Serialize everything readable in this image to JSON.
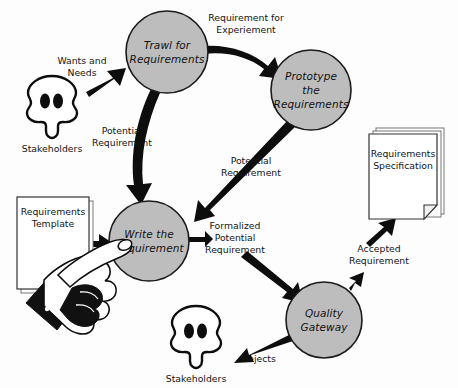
{
  "diagram": {
    "colors": {
      "node_fill": "#bdbdbd",
      "node_stroke": "#1a1a1a",
      "arrow": "#0d0d0d",
      "text": "#141414",
      "background": "#fdfdfd",
      "paper_fill": "#ffffff"
    },
    "nodes": [
      {
        "id": "trawl",
        "lines": [
          "Trawl for",
          "Requirements"
        ],
        "cx": 167,
        "cy": 52,
        "r": 41
      },
      {
        "id": "prototype",
        "lines": [
          "Prototype",
          "the",
          "Requirements"
        ],
        "cx": 311,
        "cy": 90,
        "r": 40
      },
      {
        "id": "write",
        "lines": [
          "Write the",
          "Requirement"
        ],
        "cx": 149,
        "cy": 241,
        "r": 40
      },
      {
        "id": "quality",
        "lines": [
          "Quality",
          "Gateway"
        ],
        "cx": 324,
        "cy": 320,
        "r": 38
      }
    ],
    "edge_labels": [
      {
        "id": "wants-and-needs",
        "lines": [
          "Wants and",
          "Needs"
        ],
        "x": 82,
        "y": 64
      },
      {
        "id": "requirement-for-experiement",
        "lines": [
          "Requirement for",
          "Experiement"
        ],
        "x": 246,
        "y": 33
      },
      {
        "id": "potential-requirement-left",
        "lines": [
          "Potential",
          "Requirement"
        ],
        "x": 122,
        "y": 134
      },
      {
        "id": "potential-requirement-right",
        "lines": [
          "Potential",
          "Requirement"
        ],
        "x": 251,
        "y": 164
      },
      {
        "id": "formalized-potential-requirement",
        "lines": [
          "Formalized",
          "Potential",
          "Requirement"
        ],
        "x": 235,
        "y": 229
      },
      {
        "id": "accepted-requirement",
        "lines": [
          "Accepted",
          "Requirement"
        ],
        "x": 379,
        "y": 252
      },
      {
        "id": "rejects",
        "lines": [
          "Rejects"
        ],
        "x": 259,
        "y": 362
      }
    ],
    "artifacts": [
      {
        "id": "requirements-template",
        "lines": [
          "Requirements",
          "Template"
        ],
        "x": 17,
        "y": 197,
        "w": 72,
        "h": 92
      },
      {
        "id": "requirements-specification",
        "lines": [
          "Requirements",
          "Specification"
        ],
        "x": 369,
        "y": 131,
        "w": 74,
        "h": 89
      }
    ],
    "actors": [
      {
        "id": "stakeholders-top",
        "label": "Stakeholders",
        "cx": 52,
        "cy": 101,
        "label_y": 152
      },
      {
        "id": "stakeholders-bottom",
        "label": "Stakeholders",
        "cx": 196,
        "cy": 331,
        "label_y": 382
      }
    ]
  }
}
